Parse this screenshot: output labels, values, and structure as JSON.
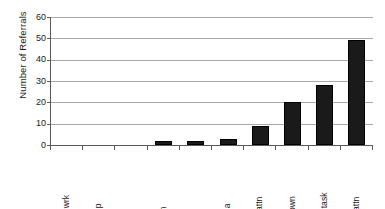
{
  "chart_data": {
    "type": "bar",
    "title": "",
    "subtitle": "",
    "xlabel": "",
    "ylabel": "Number of Referrals",
    "categories": [
      "Avoid wrk",
      "Avoid p",
      "DK",
      "Ob itm",
      "Other",
      "Avoid a",
      "Ob a attn",
      "Unknown",
      "Avoid task",
      "Ob p attn"
    ],
    "values": [
      0,
      0,
      0,
      2,
      2,
      3,
      9,
      20,
      28,
      49
    ],
    "ylim": [
      0,
      60
    ],
    "ytick_labels": [
      "0",
      "10",
      "20",
      "30",
      "40",
      "50",
      "60"
    ],
    "ytick_values": [
      0,
      10,
      20,
      30,
      40,
      50,
      60
    ],
    "grid": "horizontal",
    "legend": "none",
    "bar_color": "#1a1a1a",
    "gridline_color": "#a8a8a8",
    "axis_color": "#5a5a5a",
    "background_color": "#ffffff"
  }
}
